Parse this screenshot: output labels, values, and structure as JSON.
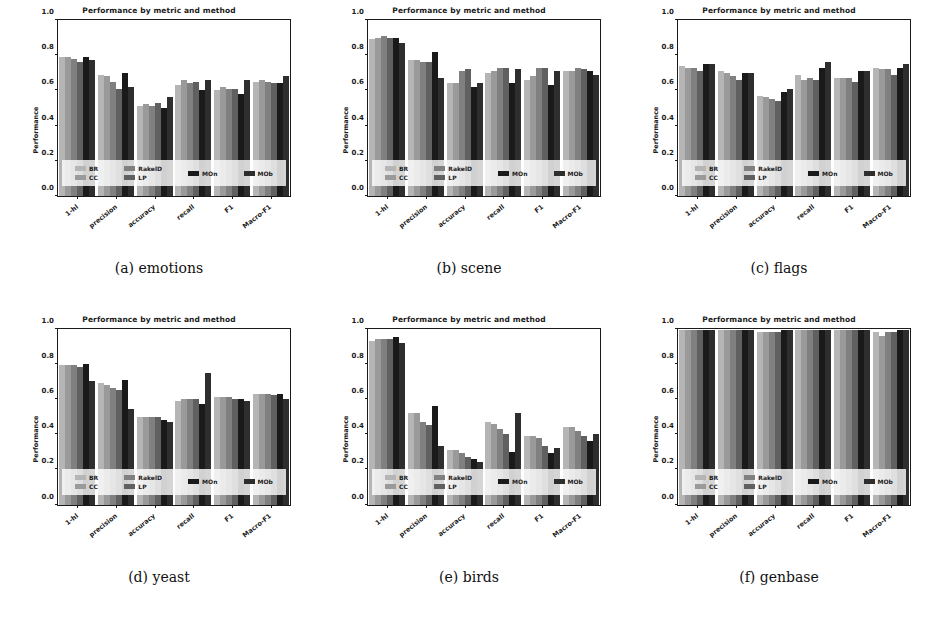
{
  "figure": {
    "chart_title": "Performance by metric and method",
    "ylabel": "Performance",
    "yticks": [
      "0.0",
      "0.2",
      "0.4",
      "0.6",
      "0.8",
      "1.0"
    ],
    "ylim": [
      0,
      1
    ],
    "categories": [
      "1-hl",
      "precision",
      "accuracy",
      "recall",
      "F1",
      "Macro-F1"
    ],
    "legend": [
      {
        "name": "BR",
        "color": "#b5b5b5"
      },
      {
        "name": "CC",
        "color": "#9a9a9a"
      },
      {
        "name": "RakelD",
        "color": "#808080"
      },
      {
        "name": "LP",
        "color": "#606060"
      },
      {
        "name": "MOn",
        "color": "#1a1a1a"
      },
      {
        "name": "MOb",
        "color": "#2e2e2e"
      }
    ],
    "legend_columns": [
      [
        "BR",
        "CC"
      ],
      [
        "RakelD",
        "LP"
      ],
      [
        "MOn"
      ],
      [
        "MOb"
      ]
    ]
  },
  "chart_data": [
    {
      "type": "bar",
      "panel": "a",
      "caption": "(a) emotions",
      "title": "Performance by metric and method",
      "xlabel": "",
      "ylabel": "Performance",
      "ylim": [
        0,
        1
      ],
      "grid": false,
      "legend_position": "lower-center-overlay",
      "categories": [
        "1-hl",
        "precision",
        "accuracy",
        "recall",
        "F1",
        "Macro-F1"
      ],
      "series": [
        {
          "name": "BR",
          "values": [
            0.79,
            0.69,
            0.51,
            0.63,
            0.6,
            0.65
          ]
        },
        {
          "name": "CC",
          "values": [
            0.79,
            0.68,
            0.52,
            0.66,
            0.62,
            0.66
          ]
        },
        {
          "name": "RakelD",
          "values": [
            0.78,
            0.65,
            0.51,
            0.64,
            0.61,
            0.65
          ]
        },
        {
          "name": "LP",
          "values": [
            0.76,
            0.61,
            0.53,
            0.65,
            0.61,
            0.64
          ]
        },
        {
          "name": "MOn",
          "values": [
            0.79,
            0.7,
            0.5,
            0.6,
            0.58,
            0.64
          ]
        },
        {
          "name": "MOb",
          "values": [
            0.77,
            0.62,
            0.56,
            0.66,
            0.66,
            0.68
          ]
        }
      ]
    },
    {
      "type": "bar",
      "panel": "b",
      "caption": "(b) scene",
      "title": "Performance by metric and method",
      "xlabel": "",
      "ylabel": "Performance",
      "ylim": [
        0,
        1
      ],
      "grid": false,
      "legend_position": "lower-center-overlay",
      "categories": [
        "1-hl",
        "precision",
        "accuracy",
        "recall",
        "F1",
        "Macro-F1"
      ],
      "series": [
        {
          "name": "BR",
          "values": [
            0.89,
            0.77,
            0.64,
            0.7,
            0.66,
            0.71
          ]
        },
        {
          "name": "CC",
          "values": [
            0.9,
            0.77,
            0.64,
            0.71,
            0.68,
            0.71
          ]
        },
        {
          "name": "RakelD",
          "values": [
            0.91,
            0.76,
            0.71,
            0.73,
            0.73,
            0.73
          ]
        },
        {
          "name": "LP",
          "values": [
            0.9,
            0.76,
            0.72,
            0.73,
            0.73,
            0.72
          ]
        },
        {
          "name": "MOn",
          "values": [
            0.9,
            0.82,
            0.62,
            0.64,
            0.63,
            0.71
          ]
        },
        {
          "name": "MOb",
          "values": [
            0.87,
            0.67,
            0.64,
            0.72,
            0.71,
            0.69
          ]
        }
      ]
    },
    {
      "type": "bar",
      "panel": "c",
      "caption": "(c) flags",
      "title": "Performance by metric and method",
      "xlabel": "",
      "ylabel": "Performance",
      "ylim": [
        0,
        1
      ],
      "grid": false,
      "legend_position": "lower-center-overlay",
      "categories": [
        "1-hl",
        "precision",
        "accuracy",
        "recall",
        "F1",
        "Macro-F1"
      ],
      "series": [
        {
          "name": "BR",
          "values": [
            0.74,
            0.71,
            0.57,
            0.69,
            0.67,
            0.73
          ]
        },
        {
          "name": "CC",
          "values": [
            0.73,
            0.7,
            0.56,
            0.66,
            0.67,
            0.72
          ]
        },
        {
          "name": "RakelD",
          "values": [
            0.73,
            0.68,
            0.55,
            0.67,
            0.67,
            0.72
          ]
        },
        {
          "name": "LP",
          "values": [
            0.71,
            0.66,
            0.54,
            0.66,
            0.65,
            0.69
          ]
        },
        {
          "name": "MOn",
          "values": [
            0.75,
            0.7,
            0.59,
            0.73,
            0.71,
            0.73
          ]
        },
        {
          "name": "MOb",
          "values": [
            0.75,
            0.7,
            0.61,
            0.76,
            0.71,
            0.75
          ]
        }
      ]
    },
    {
      "type": "bar",
      "panel": "d",
      "caption": "(d) yeast",
      "title": "Performance by metric and method",
      "xlabel": "",
      "ylabel": "Performance",
      "ylim": [
        0,
        1
      ],
      "grid": false,
      "legend_position": "lower-center-overlay",
      "categories": [
        "1-hl",
        "precision",
        "accuracy",
        "recall",
        "F1",
        "Macro-F1"
      ],
      "series": [
        {
          "name": "BR",
          "values": [
            0.79,
            0.69,
            0.5,
            0.59,
            0.61,
            0.63
          ]
        },
        {
          "name": "CC",
          "values": [
            0.79,
            0.68,
            0.5,
            0.6,
            0.61,
            0.63
          ]
        },
        {
          "name": "RakelD",
          "values": [
            0.79,
            0.66,
            0.5,
            0.6,
            0.61,
            0.63
          ]
        },
        {
          "name": "LP",
          "values": [
            0.78,
            0.65,
            0.5,
            0.6,
            0.6,
            0.62
          ]
        },
        {
          "name": "MOn",
          "values": [
            0.8,
            0.71,
            0.48,
            0.57,
            0.6,
            0.63
          ]
        },
        {
          "name": "MOb",
          "values": [
            0.7,
            0.54,
            0.47,
            0.75,
            0.59,
            0.6
          ]
        }
      ]
    },
    {
      "type": "bar",
      "panel": "e",
      "caption": "(e) birds",
      "title": "Performance by metric and method",
      "xlabel": "",
      "ylabel": "Performance",
      "ylim": [
        0,
        1
      ],
      "grid": false,
      "legend_position": "lower-center-overlay",
      "categories": [
        "1-hl",
        "precision",
        "accuracy",
        "recall",
        "F1",
        "Macro-F1"
      ],
      "series": [
        {
          "name": "BR",
          "values": [
            0.93,
            0.52,
            0.31,
            0.47,
            0.39,
            0.44
          ]
        },
        {
          "name": "CC",
          "values": [
            0.94,
            0.52,
            0.31,
            0.46,
            0.39,
            0.44
          ]
        },
        {
          "name": "RakelD",
          "values": [
            0.94,
            0.47,
            0.29,
            0.43,
            0.38,
            0.42
          ]
        },
        {
          "name": "LP",
          "values": [
            0.94,
            0.45,
            0.27,
            0.4,
            0.33,
            0.39
          ]
        },
        {
          "name": "MOn",
          "values": [
            0.95,
            0.56,
            0.26,
            0.3,
            0.29,
            0.36
          ]
        },
        {
          "name": "MOb",
          "values": [
            0.92,
            0.33,
            0.24,
            0.52,
            0.32,
            0.4
          ]
        }
      ]
    },
    {
      "type": "bar",
      "panel": "f",
      "caption": "(f) genbase",
      "title": "Performance by metric and method",
      "xlabel": "",
      "ylabel": "Performance",
      "ylim": [
        0,
        1
      ],
      "grid": false,
      "legend_position": "lower-center-overlay",
      "categories": [
        "1-hl",
        "precision",
        "accuracy",
        "recall",
        "F1",
        "Macro-F1"
      ],
      "series": [
        {
          "name": "BR",
          "values": [
            0.99,
            0.99,
            0.98,
            0.99,
            0.99,
            0.98
          ]
        },
        {
          "name": "CC",
          "values": [
            0.99,
            0.99,
            0.98,
            0.99,
            0.99,
            0.96
          ]
        },
        {
          "name": "RakelD",
          "values": [
            0.99,
            0.99,
            0.98,
            0.99,
            0.99,
            0.98
          ]
        },
        {
          "name": "LP",
          "values": [
            0.99,
            0.99,
            0.98,
            0.99,
            0.99,
            0.98
          ]
        },
        {
          "name": "MOn",
          "values": [
            0.99,
            0.99,
            0.99,
            0.99,
            0.99,
            0.99
          ]
        },
        {
          "name": "MOb",
          "values": [
            0.99,
            0.99,
            0.99,
            0.99,
            0.99,
            0.99
          ]
        }
      ]
    }
  ]
}
